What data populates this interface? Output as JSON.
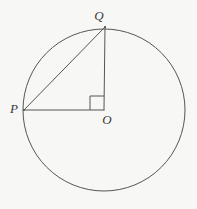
{
  "figure": {
    "background_color": "#f7f7f5",
    "stroke_color": "#555555",
    "label_color": "#3a3a3a",
    "stroke_width": 1,
    "circle": {
      "name": "circle",
      "center_x": 104,
      "center_y": 110,
      "radius": 81
    },
    "points": [
      {
        "id": "P",
        "label": "P",
        "x": 24,
        "y": 110,
        "label_x": 14,
        "label_y": 113
      },
      {
        "id": "Q",
        "label": "Q",
        "x": 105,
        "y": 27,
        "label_x": 99,
        "label_y": 20
      },
      {
        "id": "O",
        "label": "O",
        "x": 104,
        "y": 110,
        "label_x": 107,
        "label_y": 124
      }
    ],
    "segments": [
      {
        "id": "PO",
        "name": "segment-po",
        "x1": 24,
        "y1": 110,
        "x2": 104,
        "y2": 110
      },
      {
        "id": "QO",
        "name": "segment-qo",
        "x1": 105,
        "y1": 27,
        "x2": 104,
        "y2": 110
      },
      {
        "id": "PQ",
        "name": "segment-pq",
        "x1": 24,
        "y1": 110,
        "x2": 105,
        "y2": 27
      }
    ],
    "right_angle": {
      "name": "right-angle-marker",
      "vertex_x": 104,
      "vertex_y": 110,
      "size": 14,
      "path": "M 90 110 L 90 96 L 104 96"
    },
    "labels": {
      "p": "P",
      "q": "Q",
      "o": "O"
    }
  }
}
